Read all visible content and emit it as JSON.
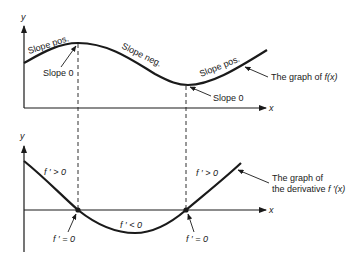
{
  "top_graph": {
    "y_axis_label": "y",
    "x_axis_label": "x",
    "labels": {
      "slope_pos_left": "Slope pos.",
      "slope_neg": "Slope neg.",
      "slope_pos_right": "Slope pos.",
      "slope_zero_max": "Slope 0",
      "slope_zero_min": "Slope 0",
      "graph_caption_prefix": "The graph of ",
      "graph_caption_fn": "f(x)"
    }
  },
  "bottom_graph": {
    "y_axis_label": "y",
    "x_axis_label": "x",
    "labels": {
      "positive_left": "f ′ > 0",
      "negative": "f ′ < 0",
      "positive_right": "f ′ > 0",
      "zero_left": "f ′ = 0",
      "zero_right": "f ′ = 0",
      "caption_line1": "The graph of",
      "caption_line2_prefix": "the derivative ",
      "caption_line2_fn": "f ′(x)"
    }
  },
  "colors": {
    "ink": "#1a1a1a",
    "background": "#ffffff"
  }
}
